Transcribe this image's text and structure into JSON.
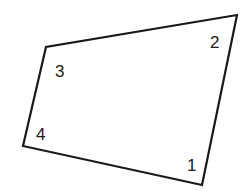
{
  "diagram": {
    "type": "quadrilateral",
    "stroke_color": "#1a1a1a",
    "fill_color": "#ffffff",
    "vertices": [
      {
        "label": "1",
        "x": 202,
        "y": 185
      },
      {
        "label": "2",
        "x": 237,
        "y": 15
      },
      {
        "label": "3",
        "x": 46,
        "y": 47
      },
      {
        "label": "4",
        "x": 23,
        "y": 146
      }
    ],
    "labels": [
      {
        "text": "1",
        "x": 187,
        "y": 171
      },
      {
        "text": "2",
        "x": 210,
        "y": 48
      },
      {
        "text": "3",
        "x": 55,
        "y": 77
      },
      {
        "text": "4",
        "x": 36,
        "y": 140
      }
    ]
  }
}
